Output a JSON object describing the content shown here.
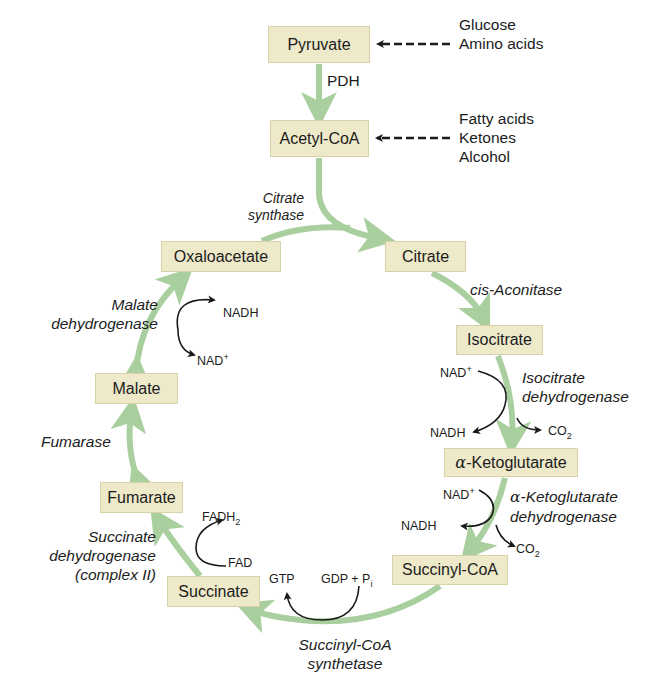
{
  "colors": {
    "box_fill": "#ede9c9",
    "box_border": "#d8d2a8",
    "pathway_arrow": "#a9cf9f",
    "cofactor_arrow": "#1a1a1a",
    "text": "#1c1c1c"
  },
  "metabolites": {
    "pyruvate": "Pyruvate",
    "acetyl_coa": "Acetyl-CoA",
    "citrate": "Citrate",
    "isocitrate": "Isocitrate",
    "alpha_ketoglutarate_prefix": "α",
    "alpha_ketoglutarate": "-Ketoglutarate",
    "succinyl_coa": "Succinyl-CoA",
    "succinate": "Succinate",
    "fumarate": "Fumarate",
    "malate": "Malate",
    "oxaloacetate": "Oxaloacetate"
  },
  "inputs": {
    "to_pyruvate": [
      "Glucose",
      "Amino acids"
    ],
    "to_acetyl_coa": [
      "Fatty acids",
      "Ketones",
      "Alcohol"
    ]
  },
  "enzymes": {
    "pdh": "PDH",
    "citrate_synthase": [
      "Citrate",
      "synthase"
    ],
    "cis_aconitase": "cis-Aconitase",
    "isocitrate_dh": [
      "Isocitrate",
      "dehydrogenase"
    ],
    "akg_dh_prefix": "α",
    "akg_dh": [
      "-Ketoglutarate",
      "dehydrogenase"
    ],
    "succinyl_coa_synthetase": [
      "Succinyl-CoA",
      "synthetase"
    ],
    "succinate_dh": [
      "Succinate",
      "dehydrogenase",
      "(complex II)"
    ],
    "fumarase": "Fumarase",
    "malate_dh": [
      "Malate",
      "dehydrogenase"
    ]
  },
  "cofactors": {
    "isocitrate_step": {
      "in": "NAD",
      "in_sup": "+",
      "out": "NADH",
      "released": "CO",
      "released_sub": "2"
    },
    "akg_step": {
      "in": "NAD",
      "in_sup": "+",
      "out": "NADH",
      "released": "CO",
      "released_sub": "2"
    },
    "succinyl_coa_step": {
      "in": "GDP + P",
      "in_sub": "i",
      "out": "GTP"
    },
    "succinate_step": {
      "in": "FAD",
      "out": "FADH",
      "out_sub": "2"
    },
    "malate_step": {
      "in": "NAD",
      "in_sup": "+",
      "out": "NADH"
    }
  }
}
